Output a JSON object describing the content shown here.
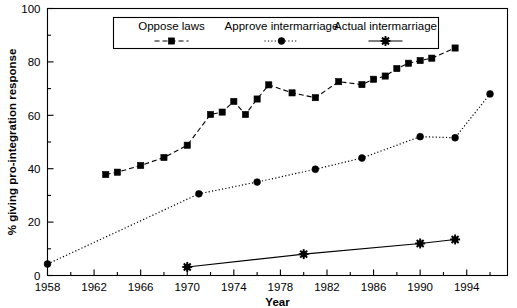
{
  "chart_data": {
    "type": "line",
    "title": "",
    "xlabel": "Year",
    "ylabel": "% giving pro-integration response",
    "xlim": [
      1958,
      1997.5
    ],
    "ylim": [
      0,
      100
    ],
    "yticks": [
      0,
      20,
      40,
      60,
      80,
      100
    ],
    "yticks_minor": [
      10,
      30,
      50,
      70,
      90
    ],
    "xticks": [
      1958,
      1960,
      1962,
      1964,
      1966,
      1968,
      1970,
      1972,
      1974,
      1976,
      1978,
      1980,
      1982,
      1984,
      1986,
      1988,
      1990,
      1992,
      1994,
      1996
    ],
    "xtick_labels": [
      "1958",
      "",
      "1962",
      "",
      "1966",
      "",
      "1970",
      "",
      "1974",
      "",
      "1978",
      "",
      "1982",
      "",
      "1986",
      "",
      "1990",
      "",
      "1994",
      ""
    ],
    "grid": false,
    "legend_position": "top-center",
    "series": [
      {
        "name": "Oppose laws",
        "marker": "square",
        "linestyle": "dashed",
        "color": "#000000",
        "x": [
          1963,
          1964,
          1966,
          1968,
          1970,
          1972,
          1973,
          1974,
          1975,
          1976,
          1977,
          1979,
          1981,
          1983,
          1985,
          1986,
          1987,
          1988,
          1989,
          1990,
          1991,
          1993
        ],
        "y": [
          37.8,
          38.7,
          41.2,
          44.2,
          48.8,
          60.3,
          61.2,
          65.2,
          60.3,
          66.1,
          71.4,
          68.4,
          66.6,
          72.6,
          71.5,
          73.5,
          74.7,
          77.5,
          79.5,
          80.5,
          81.4,
          85.2
        ]
      },
      {
        "name": "Approve intermarriage",
        "marker": "circle",
        "linestyle": "dotted",
        "color": "#000000",
        "x": [
          1958,
          1971,
          1976,
          1981,
          1985,
          1990,
          1993,
          1996
        ],
        "y": [
          4.3,
          30.6,
          35.0,
          39.8,
          44.0,
          52.0,
          51.6,
          68.0
        ]
      },
      {
        "name": "Actual intermarriage",
        "marker": "star",
        "linestyle": "solid",
        "color": "#000000",
        "x": [
          1970,
          1980,
          1990,
          1993
        ],
        "y": [
          3.2,
          8.0,
          12.0,
          13.5
        ]
      }
    ]
  },
  "legend": {
    "entries": [
      {
        "label": "Oppose laws"
      },
      {
        "label": "Approve intermarriage"
      },
      {
        "label": "Actual intermarriage"
      }
    ]
  }
}
